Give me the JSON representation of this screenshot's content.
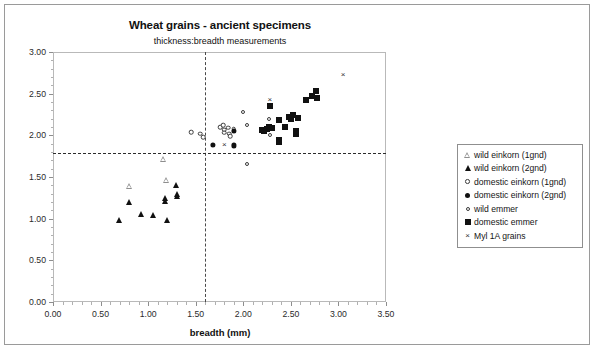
{
  "chart_data": {
    "type": "scatter",
    "title": "Wheat grains - ancient specimens",
    "subtitle": "thickness:breadth measurements",
    "xlabel": "breadth (mm)",
    "ylabel": "",
    "xlim": [
      0.0,
      3.5
    ],
    "ylim": [
      0.0,
      3.0
    ],
    "xticks": [
      "0.00",
      "0.50",
      "1.00",
      "1.50",
      "2.00",
      "2.50",
      "3.00",
      "3.50"
    ],
    "yticks": [
      "0.00",
      "0.50",
      "1.00",
      "1.50",
      "2.00",
      "2.50",
      "3.00"
    ],
    "xtick_values": [
      0.0,
      0.5,
      1.0,
      1.5,
      2.0,
      2.5,
      3.0,
      3.5
    ],
    "ytick_values": [
      0.0,
      0.5,
      1.0,
      1.5,
      2.0,
      2.5,
      3.0
    ],
    "x_minor_step": 0.1,
    "y_minor_step": 0.1,
    "grid": false,
    "legend_position": "right",
    "reference_lines": [
      {
        "name": "vertical-breadth-threshold",
        "axis": "x",
        "value": 1.6,
        "style": "dashed"
      },
      {
        "name": "horizontal-thickness-threshold",
        "axis": "y",
        "value": 1.79,
        "style": "dashed"
      }
    ],
    "series": [
      {
        "name": "wild einkorn (1gnd)",
        "marker": "triangle-open",
        "points": [
          [
            0.8,
            1.39
          ],
          [
            1.16,
            1.72
          ],
          [
            1.19,
            1.46
          ]
        ]
      },
      {
        "name": "wild einkorn (2gnd)",
        "marker": "triangle-filled",
        "points": [
          [
            0.69,
            0.99
          ],
          [
            0.8,
            1.2
          ],
          [
            0.93,
            1.06
          ],
          [
            1.05,
            1.04
          ],
          [
            1.18,
            1.25
          ],
          [
            1.18,
            1.21
          ],
          [
            1.2,
            0.99
          ],
          [
            1.29,
            1.4
          ],
          [
            1.3,
            1.3
          ],
          [
            1.3,
            1.27
          ]
        ]
      },
      {
        "name": "domestic einkorn (1gnd)",
        "marker": "circle-open",
        "points": [
          [
            1.45,
            2.04
          ],
          [
            1.55,
            2.02
          ],
          [
            1.58,
            1.98
          ],
          [
            1.76,
            2.1
          ],
          [
            1.79,
            2.12
          ],
          [
            1.8,
            2.07
          ],
          [
            1.8,
            2.03
          ],
          [
            1.84,
            2.09
          ],
          [
            1.85,
            2.02
          ],
          [
            1.86,
            1.99
          ],
          [
            1.9,
            2.08
          ]
        ]
      },
      {
        "name": "domestic einkorn (2gnd)",
        "marker": "circle-filled",
        "points": [
          [
            1.68,
            1.89
          ],
          [
            1.9,
            1.88
          ],
          [
            1.9,
            2.05
          ]
        ]
      },
      {
        "name": "wild emmer",
        "marker": "circle-open-small",
        "points": [
          [
            2.0,
            2.28
          ],
          [
            2.04,
            2.13
          ],
          [
            2.04,
            1.66
          ],
          [
            2.27,
            2.2
          ],
          [
            2.28,
            2.0
          ]
        ]
      },
      {
        "name": "domestic emmer",
        "marker": "square-filled",
        "points": [
          [
            2.2,
            2.06
          ],
          [
            2.22,
            2.05
          ],
          [
            2.25,
            2.08
          ],
          [
            2.27,
            2.1
          ],
          [
            2.28,
            2.35
          ],
          [
            2.3,
            2.09
          ],
          [
            2.38,
            2.18
          ],
          [
            2.38,
            1.95
          ],
          [
            2.38,
            1.92
          ],
          [
            2.44,
            2.1
          ],
          [
            2.48,
            2.22
          ],
          [
            2.5,
            2.2
          ],
          [
            2.52,
            2.25
          ],
          [
            2.55,
            2.05
          ],
          [
            2.55,
            2.02
          ],
          [
            2.58,
            2.21
          ],
          [
            2.66,
            2.42
          ],
          [
            2.72,
            2.47
          ],
          [
            2.76,
            2.53
          ],
          [
            2.78,
            2.45
          ]
        ]
      },
      {
        "name": "Myl 1A grains",
        "marker": "x",
        "points": [
          [
            1.8,
            1.88
          ],
          [
            2.28,
            2.42
          ],
          [
            3.05,
            2.72
          ]
        ]
      }
    ]
  },
  "legend": {
    "items": [
      {
        "label": "wild einkorn (1gnd)",
        "marker": "triangle-open"
      },
      {
        "label": "wild einkorn (2gnd)",
        "marker": "triangle-filled"
      },
      {
        "label": "domestic einkorn (1gnd)",
        "marker": "circle-open"
      },
      {
        "label": "domestic einkorn (2gnd)",
        "marker": "circle-filled"
      },
      {
        "label": "wild emmer",
        "marker": "circle-open-small"
      },
      {
        "label": "domestic emmer",
        "marker": "square-filled"
      },
      {
        "label": "Myl 1A grains",
        "marker": "x"
      }
    ]
  },
  "colors": {
    "marker": "#111111",
    "frame": "#9a9a9a",
    "axis": "#8d8d8d",
    "reference_line": "#3a3a3a",
    "background": "#ffffff"
  }
}
